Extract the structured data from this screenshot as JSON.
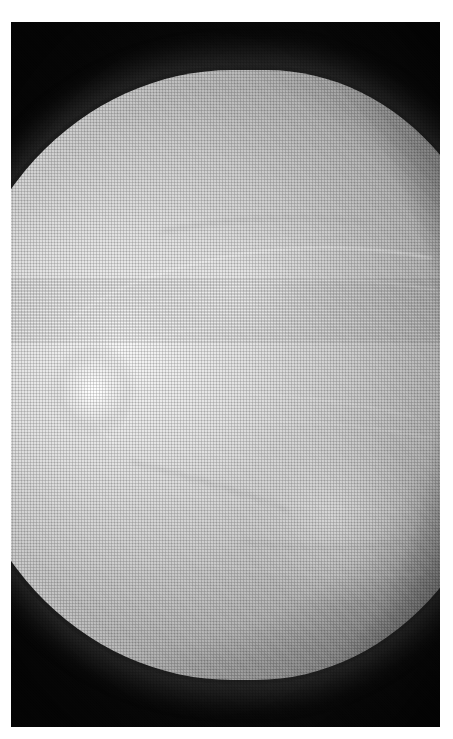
{
  "figure": {
    "modality": "mammogram",
    "view": "craniocaudal",
    "laterality_orientation": "nipple-left",
    "caption": "",
    "background_color": "#ffffff",
    "film_color": "#060606",
    "tissue_bright_color": "#f7f7f7",
    "tissue_mid_color": "#cecece",
    "tissue_edge_color": "#606060"
  },
  "plate": {
    "x": 11,
    "y": 22,
    "width": 429,
    "height": 705,
    "border_color": "#ffffff"
  },
  "regions": [
    {
      "name": "background-film",
      "label": "radiolucent background",
      "density": "black"
    },
    {
      "name": "breast-parenchyma",
      "label": "fibroglandular tissue dome",
      "density": "high"
    },
    {
      "name": "retroareolar-region",
      "label": "nipple / areolar complex",
      "density": "very-high"
    },
    {
      "name": "superior-skin-line",
      "label": "upper skin border",
      "density": "gradient"
    },
    {
      "name": "inferior-skin-line",
      "label": "lower skin border",
      "density": "gradient"
    },
    {
      "name": "chest-wall-margin",
      "label": "posterior tissue margin",
      "density": "high"
    }
  ],
  "annotations": [],
  "labels": {
    "overlay_text": ""
  }
}
